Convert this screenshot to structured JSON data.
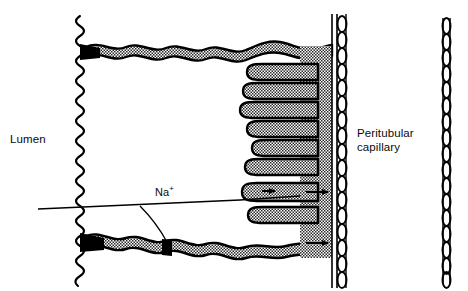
{
  "figure": {
    "kind": "biological-diagram",
    "background_color": "#ffffff",
    "ink_color": "#000000",
    "stipple_fill_color": "#d8d8d8"
  },
  "labels": {
    "lumen": "Lumen",
    "peritubular_line1": "Peritubular",
    "peritubular_line2": "capillary",
    "sodium_ion": "Na",
    "sodium_charge": "+"
  },
  "structures": {
    "brush_border": {
      "name": "microvilli-brush-border",
      "x": 78,
      "top": 16,
      "bottom": 286,
      "wave_amplitude": 7,
      "wave_period": 16
    },
    "apical_membrane": {
      "name": "apical-membrane",
      "y": 50,
      "from_x": 80,
      "to_x": 330,
      "thickness": 9
    },
    "basal_membrane": {
      "name": "basal-membrane",
      "y": 240,
      "from_x": 80,
      "to_x": 330,
      "thickness": 9
    },
    "tight_junctions": [
      {
        "name": "tight-junction-apical",
        "x": 88,
        "y": 50
      },
      {
        "name": "tight-junction-basal",
        "x": 88,
        "y": 240
      },
      {
        "name": "tight-junction-lateral",
        "x": 166,
        "y": 243
      }
    ],
    "basolateral_interdigitations": {
      "name": "basolateral-interdigitations",
      "count": 8,
      "tip_x_values": [
        247,
        243,
        240,
        247,
        252,
        245,
        242,
        248
      ],
      "y_values": [
        72,
        91,
        110,
        129,
        148,
        167,
        192,
        215
      ],
      "root_x": 318,
      "finger_thickness": 13
    },
    "lateral_intercellular_band": {
      "name": "lateral-intercellular-space",
      "x_from": 300,
      "x_to": 331
    },
    "capillary_wall_near": {
      "name": "peritubular-capillary-wall-near",
      "x": 334,
      "top": 14,
      "bottom": 288,
      "bead_count": 17
    },
    "capillary_wall_far": {
      "name": "peritubular-capillary-wall-far",
      "x": 446,
      "top": 18,
      "bottom": 284,
      "bead_count": 18
    }
  },
  "annotations": {
    "na_leader_line": {
      "name": "sodium-leader-line",
      "from_x": 38,
      "from_y": 209,
      "to_x": 300,
      "to_y": 196
    },
    "na_branch_line": {
      "name": "sodium-branch-to-junction",
      "from_x": 140,
      "from_y": 206,
      "to_x": 167,
      "to_y": 243
    },
    "arrows": [
      {
        "name": "sodium-arrow-intracellular",
        "x": 272,
        "y": 190,
        "direction": "right"
      },
      {
        "name": "sodium-arrow-to-capillary",
        "x": 322,
        "y": 192,
        "direction": "right"
      },
      {
        "name": "sodium-arrow-basal-to-capillary",
        "x": 322,
        "y": 242,
        "direction": "right"
      }
    ]
  }
}
